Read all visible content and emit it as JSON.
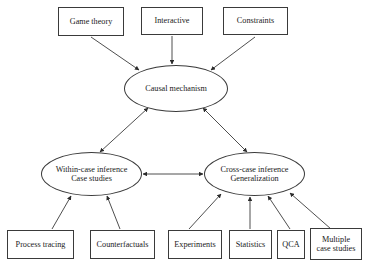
{
  "diagram": {
    "background_color": "#ffffff",
    "stroke_color": "#3a3a3a",
    "text_color": "#1a1a1a",
    "top_inputs": [
      {
        "id": "game-theory",
        "label": "Game theory"
      },
      {
        "id": "interactive",
        "label": "Interactive"
      },
      {
        "id": "constraints",
        "label": "Constraints"
      }
    ],
    "central": {
      "id": "causal-mechanism",
      "label": "Causal mechanism"
    },
    "branches": [
      {
        "id": "within-case-inference",
        "label": "Within-case inference\nCase studies"
      },
      {
        "id": "cross-case-inference",
        "label": "Cross-case inference\nGeneralization"
      }
    ],
    "left_methods": [
      {
        "id": "process-tracing",
        "label": "Process tracing"
      },
      {
        "id": "counterfactuals",
        "label": "Counterfactuals"
      }
    ],
    "right_methods": [
      {
        "id": "experiments",
        "label": "Experiments"
      },
      {
        "id": "statistics",
        "label": "Statistics"
      },
      {
        "id": "qca",
        "label": "QCA"
      },
      {
        "id": "multiple-case-studies",
        "label": "Multiple\ncase studies"
      }
    ],
    "connections": [
      {
        "from": "game-theory",
        "to": "causal-mechanism",
        "style": "single-arrow"
      },
      {
        "from": "interactive",
        "to": "causal-mechanism",
        "style": "single-arrow"
      },
      {
        "from": "constraints",
        "to": "causal-mechanism",
        "style": "single-arrow"
      },
      {
        "from": "causal-mechanism",
        "to": "within-case-inference",
        "style": "double-arrow"
      },
      {
        "from": "causal-mechanism",
        "to": "cross-case-inference",
        "style": "double-arrow"
      },
      {
        "from": "within-case-inference",
        "to": "cross-case-inference",
        "style": "double-arrow"
      },
      {
        "from": "process-tracing",
        "to": "within-case-inference",
        "style": "single-arrow"
      },
      {
        "from": "counterfactuals",
        "to": "within-case-inference",
        "style": "single-arrow"
      },
      {
        "from": "experiments",
        "to": "cross-case-inference",
        "style": "single-arrow"
      },
      {
        "from": "statistics",
        "to": "cross-case-inference",
        "style": "single-arrow"
      },
      {
        "from": "qca",
        "to": "cross-case-inference",
        "style": "single-arrow"
      },
      {
        "from": "multiple-case-studies",
        "to": "cross-case-inference",
        "style": "single-arrow"
      }
    ]
  }
}
